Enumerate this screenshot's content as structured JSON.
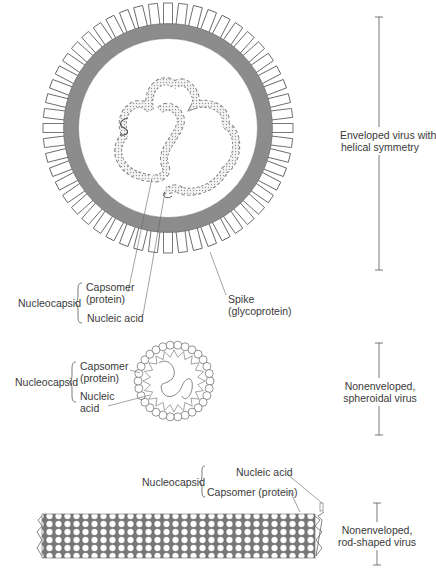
{
  "figure": {
    "panels": [
      {
        "id": "enveloped",
        "scale_label": "Enveloped virus with helical symmetry",
        "scale_label_lines": [
          "Enveloped virus with",
          "helical symmetry"
        ],
        "group_label": "Nucleocapsid",
        "parts": [
          "Capsomer (protein)",
          "Nucleic acid"
        ],
        "parts_lines": {
          "capsomer": [
            "Capsomer",
            "(protein)"
          ],
          "nucleic": "Nucleic acid"
        },
        "spike_lines": [
          "Spike",
          "(glycoprotein)"
        ]
      },
      {
        "id": "spheroidal",
        "scale_label_lines": [
          "Nonenveloped,",
          "spheroidal virus"
        ],
        "group_label": "Nucleocapsid",
        "parts_lines": {
          "capsomer": [
            "Capsomer",
            "(protein)"
          ],
          "nucleic": [
            "Nucleic",
            "acid"
          ]
        }
      },
      {
        "id": "rod",
        "scale_label_lines": [
          "Nonenveloped,",
          "rod-shaped virus"
        ],
        "group_label": "Nucleocapsid",
        "parts_lines": {
          "nucleic": "Nucleic acid",
          "capsomer": "Capsomer (protein)"
        }
      }
    ]
  },
  "colors": {
    "envelope": "#8c8c8c",
    "line": "#555555",
    "text": "#3a3a3a"
  }
}
